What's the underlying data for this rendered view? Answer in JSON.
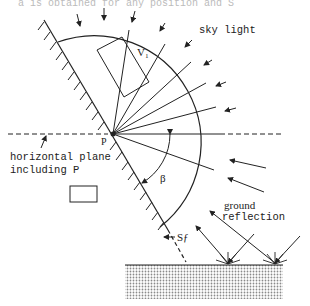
{
  "top_caption_fragment": "a is obtained for any position and S_f",
  "labels": {
    "sky_light": "sky light",
    "v1": "V₁",
    "point_p": "P",
    "horizontal_plane_line1": "horizontal plane",
    "horizontal_plane_line2": "including P",
    "beta": "β",
    "ground_line1": "ground",
    "ground_line2": "reflection",
    "surface": "Sƒ"
  },
  "colors": {
    "ink": "#222222",
    "background": "#ffffff",
    "ground_fill": "#cfcfcf"
  },
  "geometry": {
    "point_p": [
      113,
      134
    ],
    "hemisphere_radius": 107,
    "surface_slope_deg": 57
  }
}
